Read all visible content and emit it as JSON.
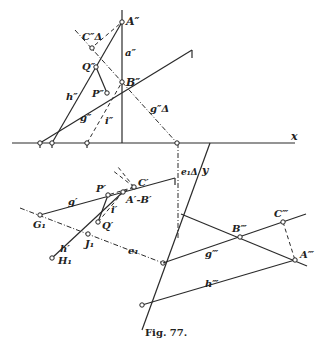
{
  "figure": {
    "caption": "Fig. 77.",
    "axes": {
      "x_label": "x",
      "y_label": "y"
    },
    "labels": {
      "A2": "A″",
      "B2": "B″",
      "C2d": "C″Δ",
      "Q2": "Q″",
      "P2": "P″",
      "a2": "a″",
      "h2": "h″",
      "g2": "g″",
      "i2": "i″",
      "g2d": "g″Δ",
      "e1d": "e₁Δ",
      "C1": "C′",
      "P1": "P′",
      "A1B1": "A′-B′",
      "g1": "g′",
      "i1": "i′",
      "Q1": "Q′",
      "G1": "G₁",
      "J1": "J₁",
      "h1": "h′",
      "H1": "H₁",
      "e1": "e₁",
      "B3": "B‴",
      "C3": "C‴",
      "A3": "A‴",
      "g3": "g‴",
      "h3": "h‴"
    }
  }
}
